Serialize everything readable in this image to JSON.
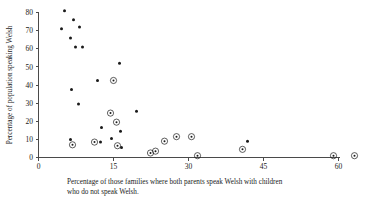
{
  "chart_data": {
    "type": "scatter",
    "title": "",
    "xlabel": "Percentage of those families where both parents speak Welsh with children who do not speak Welsh.",
    "xlabel_line1": "Percentage of those families where both parents speak Welsh with children",
    "xlabel_line2": "who do not speak Welsh.",
    "ylabel": "Percentage of population speaking Welsh",
    "xlim": [
      0,
      64
    ],
    "ylim": [
      0,
      84
    ],
    "xticks": [
      0,
      15,
      30,
      45,
      60
    ],
    "yticks": [
      0,
      10,
      20,
      30,
      40,
      50,
      60,
      70,
      80
    ],
    "xtick_labels": [
      "0",
      "15",
      "30",
      "45",
      "60"
    ],
    "ytick_labels": [
      "0",
      "10",
      "20",
      "30",
      "40",
      "50",
      "60",
      "70",
      "80"
    ],
    "grid": false,
    "legend": "none",
    "marker_colors": {
      "filled": "#1a1a1a",
      "circled_ring": "#1a1a1a",
      "axis": "#4a4a4a"
    },
    "series": [
      {
        "name": "filled",
        "marker": "filled-dot",
        "points": [
          {
            "x": 5.2,
            "y": 81.0
          },
          {
            "x": 4.6,
            "y": 71.0
          },
          {
            "x": 7.0,
            "y": 76.0
          },
          {
            "x": 8.2,
            "y": 72.0
          },
          {
            "x": 6.4,
            "y": 66.0
          },
          {
            "x": 7.4,
            "y": 61.0
          },
          {
            "x": 8.8,
            "y": 61.0
          },
          {
            "x": 16.2,
            "y": 52.0
          },
          {
            "x": 11.8,
            "y": 42.5
          },
          {
            "x": 6.6,
            "y": 37.5
          },
          {
            "x": 8.0,
            "y": 29.5
          },
          {
            "x": 19.6,
            "y": 25.5
          },
          {
            "x": 12.6,
            "y": 16.5
          },
          {
            "x": 16.4,
            "y": 14.5
          },
          {
            "x": 14.6,
            "y": 10.5
          },
          {
            "x": 6.4,
            "y": 10.0
          },
          {
            "x": 12.4,
            "y": 8.5
          },
          {
            "x": 16.6,
            "y": 5.5
          },
          {
            "x": 41.8,
            "y": 9.0
          }
        ]
      },
      {
        "name": "circled",
        "marker": "circled-dot",
        "points": [
          {
            "x": 15.0,
            "y": 42.5
          },
          {
            "x": 14.4,
            "y": 24.5
          },
          {
            "x": 15.6,
            "y": 19.5
          },
          {
            "x": 6.8,
            "y": 7.0
          },
          {
            "x": 11.2,
            "y": 8.5
          },
          {
            "x": 15.8,
            "y": 6.5
          },
          {
            "x": 25.2,
            "y": 9.0
          },
          {
            "x": 27.6,
            "y": 11.5
          },
          {
            "x": 30.6,
            "y": 11.5
          },
          {
            "x": 22.4,
            "y": 2.5
          },
          {
            "x": 23.4,
            "y": 3.5
          },
          {
            "x": 31.8,
            "y": 1.0
          },
          {
            "x": 40.8,
            "y": 4.5
          },
          {
            "x": 59.0,
            "y": 1.0
          },
          {
            "x": 63.2,
            "y": 1.0
          }
        ]
      }
    ]
  },
  "figure": {
    "name": "welsh-language-scatter-plot"
  }
}
